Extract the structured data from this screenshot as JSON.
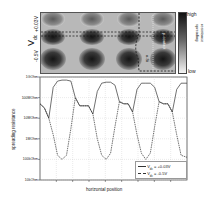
{
  "map": {
    "ylabel": "V",
    "ylabel_sub": "dc",
    "row_top_label": "+0.03V",
    "row_bottom_label": "-0.5V",
    "region_labels": [
      "n-Si",
      "p-contact"
    ],
    "colorbar": {
      "high": "high",
      "low": "low",
      "title_line1": "spreading",
      "title_line2": "resistance"
    }
  },
  "chart_data": {
    "type": "line",
    "title": "",
    "xlabel": "horizontal position",
    "ylabel": "spreading resistance",
    "yscale": "log",
    "yticks": [
      "1GOhm",
      "100MOhm",
      "10MOhm",
      "1MOhm",
      "100kOhm",
      "10kOhm"
    ],
    "ylim": [
      "10kOhm",
      "1GOhm"
    ],
    "grid": true,
    "legend_position": "lower right",
    "x": [
      0,
      3,
      6,
      9,
      12,
      15,
      18,
      21,
      24,
      27,
      30,
      33,
      36,
      39,
      42,
      45,
      48,
      51,
      54,
      57,
      60,
      63,
      66,
      69,
      72,
      75,
      78,
      81,
      84,
      87,
      90,
      93,
      96,
      100
    ],
    "series": [
      {
        "name": "V_dc = +0.03V",
        "style": "solid",
        "log10_ohm": [
          7.7,
          7.5,
          7.0,
          8.5,
          8.8,
          8.85,
          8.85,
          8.8,
          8.0,
          7.6,
          7.6,
          7.6,
          7.2,
          8.3,
          8.7,
          8.75,
          8.75,
          8.6,
          7.8,
          7.7,
          7.7,
          7.3,
          8.4,
          8.7,
          8.7,
          8.7,
          8.5,
          7.8,
          7.7,
          7.7,
          7.3,
          8.4,
          8.7,
          8.7
        ]
      },
      {
        "name": "V_dc = -0.5V",
        "style": "dashed",
        "log10_ohm": [
          7.7,
          7.5,
          7.0,
          6.2,
          5.2,
          5.0,
          5.2,
          6.5,
          8.0,
          7.6,
          7.6,
          7.6,
          7.2,
          6.0,
          5.2,
          5.0,
          5.3,
          6.6,
          7.8,
          7.7,
          7.7,
          7.3,
          6.2,
          5.3,
          5.0,
          5.3,
          6.6,
          7.8,
          7.7,
          7.7,
          7.3,
          6.2,
          5.2,
          5.1
        ]
      }
    ]
  },
  "legend": {
    "items": [
      {
        "label": "V",
        "sub": "dc",
        "value": " = +0.03V"
      },
      {
        "label": "V",
        "sub": "dc",
        "value": " = -0.5V"
      }
    ]
  }
}
